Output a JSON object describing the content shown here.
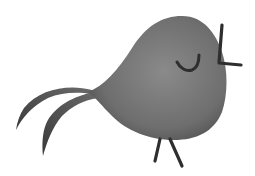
{
  "illustration": {
    "subject": "cartoon-bird",
    "colors": {
      "background": "#ffffff",
      "body_light": "#8a8a8a",
      "body_mid": "#6e6e6e",
      "body_dark": "#4a4a4a",
      "line": "#2e2e2e"
    }
  }
}
